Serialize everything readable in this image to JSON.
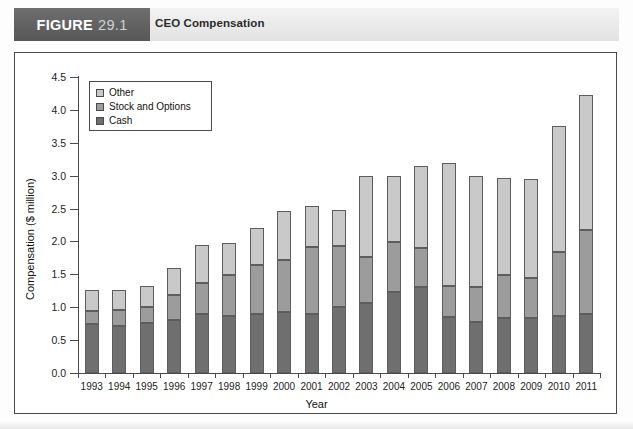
{
  "header": {
    "figure_word": "FIGURE",
    "figure_number": "29.1",
    "title": "CEO Compensation",
    "badge_color": "#606060",
    "bar_color": "#eaeaea"
  },
  "legend": {
    "position": "top-left-inside",
    "items": [
      {
        "label": "Other",
        "color": "#c9c9c9",
        "icon": "legend-swatch-icon"
      },
      {
        "label": "Stock and Options",
        "color": "#9c9c9c",
        "icon": "legend-swatch-icon"
      },
      {
        "label": "Cash",
        "color": "#6f6f6f",
        "icon": "legend-swatch-icon"
      }
    ]
  },
  "axes": {
    "y_title": "Compensation ($ million)",
    "x_title": "Year",
    "y_ticks": [
      "0.0",
      "0.5",
      "1.0",
      "1.5",
      "2.0",
      "2.5",
      "3.0",
      "3.5",
      "4.0",
      "4.5"
    ],
    "y_min": 0.0,
    "y_max": 4.5
  },
  "chart_data": {
    "type": "bar",
    "title": "CEO Compensation",
    "xlabel": "Year",
    "ylabel": "Compensation ($ million)",
    "ylim": [
      0,
      4.5
    ],
    "ytick_step": 0.5,
    "grid": false,
    "stacked": true,
    "legend_position": "upper left",
    "categories": [
      "1993",
      "1994",
      "1995",
      "1996",
      "1997",
      "1998",
      "1999",
      "2000",
      "2001",
      "2002",
      "2003",
      "2004",
      "2005",
      "2006",
      "2007",
      "2008",
      "2009",
      "2010",
      "2011"
    ],
    "series": [
      {
        "name": "Cash",
        "color": "#6f6f6f",
        "values": [
          0.74,
          0.71,
          0.76,
          0.81,
          0.89,
          0.86,
          0.89,
          0.92,
          0.89,
          1.01,
          1.07,
          1.23,
          1.3,
          0.85,
          0.78,
          0.83,
          0.83,
          0.86,
          0.9
        ]
      },
      {
        "name": "Stock and Options",
        "color": "#9c9c9c",
        "values": [
          0.2,
          0.25,
          0.24,
          0.37,
          0.48,
          0.63,
          0.75,
          0.8,
          1.03,
          0.92,
          0.69,
          0.76,
          0.6,
          0.47,
          0.53,
          0.66,
          0.62,
          0.98,
          1.27
        ]
      },
      {
        "name": "Other",
        "color": "#c9c9c9",
        "values": [
          0.32,
          0.3,
          0.32,
          0.42,
          0.57,
          0.49,
          0.56,
          0.74,
          0.62,
          0.55,
          1.24,
          1.01,
          1.24,
          1.88,
          1.69,
          1.47,
          1.5,
          1.91,
          2.05
        ]
      }
    ],
    "totals": [
      1.26,
      1.26,
      1.32,
      1.6,
      1.94,
      1.98,
      2.2,
      2.46,
      2.54,
      2.48,
      3.0,
      3.0,
      3.14,
      3.2,
      3.0,
      2.96,
      2.95,
      3.75,
      4.22
    ]
  }
}
